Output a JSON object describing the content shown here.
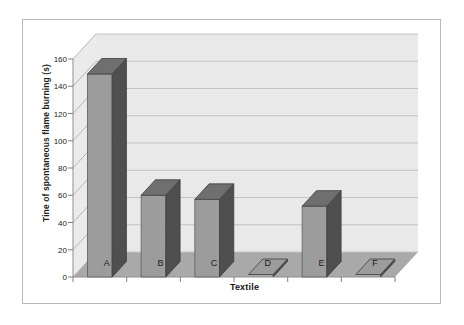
{
  "chart_data": {
    "type": "bar",
    "title": "",
    "subtitle": "",
    "xlabel": "Textile",
    "ylabel": "Tine of spontaneous flame burning (s)",
    "categories": [
      "A",
      "B",
      "C",
      "D",
      "E",
      "F"
    ],
    "values": [
      149,
      60,
      57,
      0,
      52,
      0
    ],
    "ylim": [
      0,
      160
    ],
    "ytick_labels": [
      "0",
      "20",
      "40",
      "60",
      "80",
      "100",
      "120",
      "140",
      "160"
    ],
    "ytick_values": [
      0,
      20,
      40,
      60,
      80,
      100,
      120,
      140,
      160
    ],
    "grid": true,
    "legend": false,
    "legend_position": "none",
    "style": "3d-column",
    "series": [
      {
        "name": "Time of spontaneous flame burning",
        "values": [
          149,
          60,
          57,
          0,
          52,
          0
        ]
      }
    ]
  },
  "colors": {
    "bar_front": "#9c9c9c",
    "bar_side": "#4f4f4f",
    "bar_top": "#6f6f6f",
    "wall": "#e8e8e8",
    "wall_side": "#dcdcdc",
    "floor": "#a8a8a8",
    "gridline": "#bdbdbd",
    "axis": "#8a8a8a",
    "frame_border": "#b9b9b9",
    "text": "#1b1b1b",
    "page_background": "#ffffff"
  },
  "axes": {
    "y_axis_name": "y-axis",
    "x_axis_name": "x-axis"
  }
}
